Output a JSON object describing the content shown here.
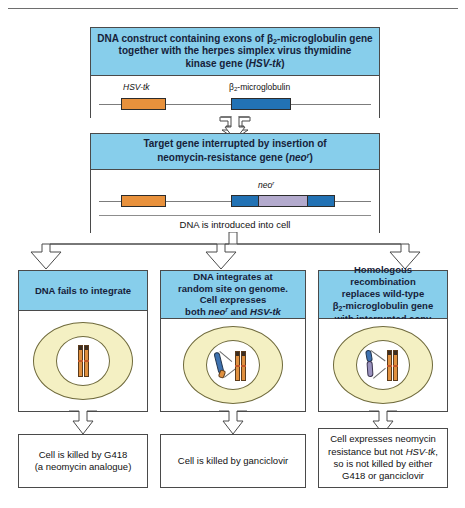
{
  "figure": {
    "title_rule": "top-divider"
  },
  "step1": {
    "heading_line1": "DNA construct containing exons of β",
    "heading_sub1": "2",
    "heading_line1b": "-microglobulin gene",
    "heading_line2": "together with the herpes simplex virus thymidine",
    "heading_line3a": "kinase gene (",
    "heading_line3b": "HSV-tk",
    "heading_line3c": ")",
    "gene_left_label": "HSV-tk",
    "gene_right_label_a": "β",
    "gene_right_label_sub": "2",
    "gene_right_label_b": "-microglobulin",
    "colors": {
      "hsv_tk": "#E8913C",
      "b2m": "#2272B4",
      "header": "#87CEEB"
    }
  },
  "step2": {
    "heading_line1": "Target gene interrupted by insertion of",
    "heading_line2a": "neomycin-resistance gene (",
    "heading_line2b": "neo",
    "heading_line2sup": "r",
    "heading_line2c": ")",
    "neo_label_a": "neo",
    "neo_label_sup": "r",
    "caption": "DNA is introduced into cell",
    "colors": {
      "neo": "#B3AACD"
    }
  },
  "outcomes": [
    {
      "id": "fails-to-integrate",
      "heading_lines": [
        "DNA fails to integrate"
      ],
      "result_lines": [
        "Cell is killed by G418",
        "(a neomycin analogue)"
      ],
      "cell": {
        "has_free_dna": false,
        "chromosome_pair": "wild-type"
      }
    },
    {
      "id": "random-integration",
      "heading_lines": [
        "DNA integrates at",
        "random site on genome.",
        "Cell expresses",
        "both neoʳ and HSV-tk"
      ],
      "heading_rich": {
        "line4_pre": "both ",
        "line4_neo": "neo",
        "line4_neo_sup": "r",
        "line4_mid": " and ",
        "line4_hsv": "HSV-tk"
      },
      "result_lines": [
        "Cell is killed by ganciclovir"
      ],
      "cell": {
        "has_free_dna": true,
        "free_dna_color": "#3E72B0",
        "chromosome_pair": "wild-type"
      }
    },
    {
      "id": "homologous-recombination",
      "heading_lines": [
        "Homologous recombination",
        "replaces wild-type",
        "β2-microglobulin gene",
        "with interrupted copy"
      ],
      "heading_rich": {
        "line3_beta": "β",
        "line3_sub": "2",
        "line3_rest": "-microglobulin gene"
      },
      "result_lines": [
        "Cell expresses neomycin",
        "resistance but not HSV-tk,",
        "so is not killed by either",
        "G418 or ganciclovir"
      ],
      "result_rich": {
        "line2_pre": "resistance but not ",
        "line2_ital": "HSV-tk",
        "line2_post": ","
      },
      "cell": {
        "has_free_dna": true,
        "free_dna_color": "#9A92BE",
        "chromosome_pair": "interrupted"
      }
    }
  ],
  "palette": {
    "header_blue": "#87CEEB",
    "cell_yellow": "#F4F0C3",
    "chromosome_orange": "#E0903F",
    "stroke": "#4a4a4a"
  }
}
